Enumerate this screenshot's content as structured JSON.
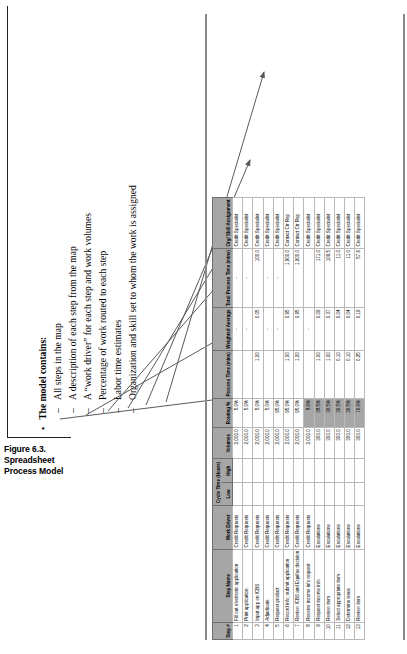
{
  "caption": {
    "label": "Figure 6.3.  Spreadsheet Process Model"
  },
  "bullets": {
    "heading": "The model contains:",
    "bullet_char": "•",
    "dash_char": "–",
    "items": [
      "All steps in the map",
      "A description of each step from the map",
      "A “work driver” for each step and work volumes",
      "Percentage of work routed to each step",
      "Labor time estimates",
      "Organization and skill set to whom the work is assigned"
    ]
  },
  "table": {
    "group_headers": {
      "cycle_time": "Cycle Time (Hours)"
    },
    "columns": [
      "Step #",
      "Step Name",
      "Work Driver",
      "Low",
      "High",
      "Volumes",
      "Routing %",
      "Process Time (mins)",
      "Weighted Average",
      "Total Process Time (mins)",
      "Org/ Skill Assignment"
    ],
    "rows": [
      {
        "step": "1",
        "name": "Fill out electronic application",
        "driver": "Credit Requests",
        "low": "",
        "high": "",
        "vol": "2,000.0",
        "routing": "5.0%",
        "ptime": "",
        "wavg": "-",
        "total": "-",
        "org": "Credit Specialist",
        "shaded": false
      },
      {
        "step": "2",
        "name": "Print application",
        "driver": "Credit Requests",
        "low": "",
        "high": "",
        "vol": "2,000.0",
        "routing": "5.0%",
        "ptime": "",
        "wavg": "-",
        "total": "-",
        "org": "Credit Specialist",
        "shaded": false
      },
      {
        "step": "3",
        "name": "Input app on ICBS",
        "driver": "Credit Requests",
        "low": "",
        "high": "",
        "vol": "2,000.0",
        "routing": "5.0%",
        "ptime": "1.00",
        "wavg": "0.05",
        "total": "100.0",
        "org": "Credit Specialist",
        "shaded": false
      },
      {
        "step": "4",
        "name": "Adjudicate",
        "driver": "Credit Requests",
        "low": "",
        "high": "",
        "vol": "2,000.0",
        "routing": "5.0%",
        "ptime": "",
        "wavg": "-",
        "total": "-",
        "org": "Credit Specialist",
        "shaded": false
      },
      {
        "step": "5",
        "name": "Request product",
        "driver": "Credit Requests",
        "low": "",
        "high": "",
        "vol": "2,000.0",
        "routing": "95.0%",
        "ptime": "",
        "wavg": "-",
        "total": "-",
        "org": "Credit Specialist",
        "shaded": false
      },
      {
        "step": "6",
        "name": "Record info, submit application",
        "driver": "Credit Requests",
        "low": "",
        "high": "",
        "vol": "2,000.0",
        "routing": "95.0%",
        "ptime": "1.00",
        "wavg": "0.95",
        "total": "1,900.0",
        "org": "Contact Ctr Rep",
        "shaded": false
      },
      {
        "step": "7",
        "name": "Review ICBS and Equifax decision",
        "driver": "Credit Requests",
        "low": "",
        "high": "",
        "vol": "2,000.0",
        "routing": "95.0%",
        "ptime": "1.00",
        "wavg": "0.95",
        "total": "1,900.0",
        "org": "Contact Ctr Rep",
        "shaded": false
      },
      {
        "step": "8",
        "name": "Receive income info request",
        "driver": "Credit Requests",
        "low": "",
        "high": "",
        "vol": "2,000.0",
        "routing": "8.6%",
        "ptime": "",
        "wavg": "-",
        "total": "",
        "org": "Credit Specialist",
        "shaded": true
      },
      {
        "step": "9",
        "name": "Request income info",
        "driver": "Escalations",
        "low": "",
        "high": "",
        "vol": "300.0",
        "routing": "38.5%",
        "ptime": "1.00",
        "wavg": "0.09",
        "total": "171.0",
        "org": "Credit Specialist",
        "shaded": true
      },
      {
        "step": "10",
        "name": "Review item",
        "driver": "Escalations",
        "low": "",
        "high": "",
        "vol": "300.0",
        "routing": "36.5%",
        "ptime": "1.00",
        "wavg": "0.37",
        "total": "109.5",
        "org": "Credit Specialist",
        "shaded": true
      },
      {
        "step": "11",
        "name": "Select appropriate item",
        "driver": "Escalations",
        "low": "",
        "high": "",
        "vol": "300.0",
        "routing": "36.5%",
        "ptime": "0.10",
        "wavg": "0.04",
        "total": "11.0",
        "org": "Credit Specialist",
        "shaded": true
      },
      {
        "step": "12",
        "name": "Determine issue",
        "driver": "Escalations",
        "low": "",
        "high": "",
        "vol": "300.0",
        "routing": "36.5%",
        "ptime": "0.10",
        "wavg": "0.04",
        "total": "11.0",
        "org": "Credit Specialist",
        "shaded": true
      },
      {
        "step": "13",
        "name": "Review  item",
        "driver": "Escalations",
        "low": "",
        "high": "",
        "vol": "300.0",
        "routing": "76.6%",
        "ptime": "0.25",
        "wavg": "0.19",
        "total": "57.6",
        "org": "Credit Specialist",
        "shaded": true
      }
    ]
  },
  "colors": {
    "header_fill": "#a6a6a6",
    "grid": "#b9b9b9",
    "arrow": "#595959",
    "rule": "#231f20"
  }
}
